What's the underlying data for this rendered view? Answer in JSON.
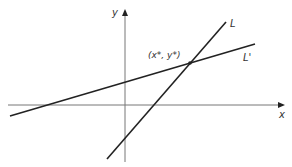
{
  "diagram": {
    "type": "two-line intersection",
    "axes": {
      "x_label": "x",
      "y_label": "y",
      "color": "#777777"
    },
    "lines": [
      {
        "id": "L",
        "label": "L",
        "color": "#222222",
        "x1": 107,
        "y1": 159,
        "x2": 226,
        "y2": 22
      },
      {
        "id": "Lprime",
        "label": "L'",
        "color": "#222222",
        "x1": 10,
        "y1": 116,
        "x2": 255,
        "y2": 44
      }
    ],
    "intersection": {
      "label": "(x*, y*)",
      "x": 190,
      "y": 63
    }
  }
}
